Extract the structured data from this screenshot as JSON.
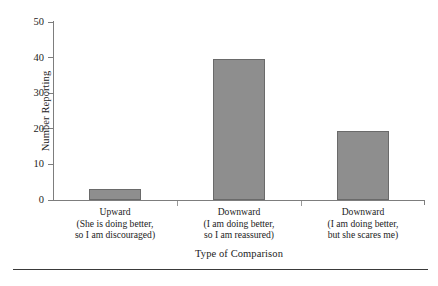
{
  "chart_data": {
    "type": "bar",
    "title": "",
    "xlabel": "Type of Comparison",
    "ylabel": "Number Reporting",
    "categories": [
      "Upward (She is doing better, so I am discouraged)",
      "Downward (I am doing better, so I am reassured)",
      "Downward (I am doing better, but she scares me)"
    ],
    "category_lines": [
      [
        "Upward",
        "(She is doing better,",
        "so I am discouraged)"
      ],
      [
        "Downward",
        "(I am doing better,",
        "so I am reassured)"
      ],
      [
        "Downward",
        "(I am doing better,",
        "but she scares me)"
      ]
    ],
    "values": [
      3,
      39.5,
      19.3
    ],
    "ylim": [
      0,
      50
    ],
    "yticks": [
      0,
      10,
      20,
      30,
      40,
      50
    ],
    "ytick_labels": [
      "0",
      "10",
      "20",
      "30",
      "40",
      "50"
    ],
    "grid": false,
    "legend": false,
    "bar_fill_color": "#8e8e8e",
    "bar_border_color": "#6a6a6a",
    "axis_color": "#7d7d7d"
  },
  "figure": {
    "y_axis_title": "Number Reporting",
    "x_axis_title": "Type of Comparison"
  }
}
